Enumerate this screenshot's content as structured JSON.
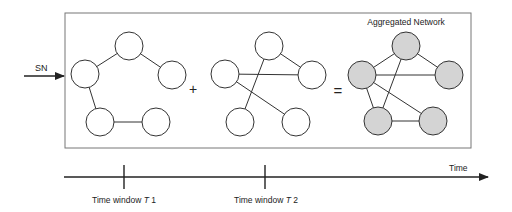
{
  "input_label": "SN",
  "operators": {
    "plus": "+",
    "equals": "="
  },
  "aggregated_title": "Aggregated Network",
  "timeline": {
    "axis_label": "Time",
    "ticks": [
      {
        "label_prefix": "Time window ",
        "label_var": "T",
        "label_suffix": " 1"
      },
      {
        "label_prefix": "Time window ",
        "label_var": "T",
        "label_suffix": " 2"
      }
    ]
  },
  "colors": {
    "node_fill_plain": "#ffffff",
    "node_fill_aggregated": "#d4d4d4",
    "stroke": "#333333"
  },
  "networks": [
    {
      "name": "network-t1",
      "aggregated": false,
      "nodes": [
        "top",
        "left",
        "right",
        "bottom-left",
        "bottom-right"
      ],
      "edges": [
        [
          "top",
          "left"
        ],
        [
          "top",
          "right"
        ],
        [
          "left",
          "bottom-left"
        ],
        [
          "bottom-left",
          "bottom-right"
        ]
      ]
    },
    {
      "name": "network-t2",
      "aggregated": false,
      "nodes": [
        "top",
        "left",
        "right",
        "bottom-left",
        "bottom-right"
      ],
      "edges": [
        [
          "top",
          "right"
        ],
        [
          "left",
          "right"
        ],
        [
          "top",
          "bottom-left"
        ],
        [
          "left",
          "bottom-right"
        ]
      ]
    },
    {
      "name": "network-aggregated",
      "aggregated": true,
      "nodes": [
        "top",
        "left",
        "right",
        "bottom-left",
        "bottom-right"
      ],
      "edges": [
        [
          "top",
          "left"
        ],
        [
          "top",
          "right"
        ],
        [
          "left",
          "right"
        ],
        [
          "left",
          "bottom-left"
        ],
        [
          "top",
          "bottom-left"
        ],
        [
          "left",
          "bottom-right"
        ],
        [
          "bottom-left",
          "bottom-right"
        ]
      ]
    }
  ]
}
